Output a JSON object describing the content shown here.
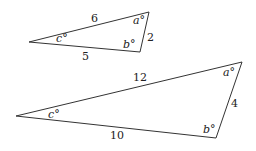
{
  "diagram": {
    "triangles": [
      {
        "name": "small",
        "vertices": {
          "left": [
            29,
            42
          ],
          "top_right": [
            149,
            12
          ],
          "bottom": [
            140,
            52
          ]
        },
        "sides": {
          "top": "6",
          "right": "2",
          "bottom": "5"
        },
        "angles": {
          "a": "a°",
          "b": "b°",
          "c": "c°"
        }
      },
      {
        "name": "large",
        "vertices": {
          "left": [
            16,
            116
          ],
          "top_right": [
            242,
            62
          ],
          "bottom": [
            216,
            138
          ]
        },
        "sides": {
          "top": "12",
          "right": "4",
          "bottom": "10"
        },
        "angles": {
          "a": "a°",
          "b": "b°",
          "c": "c°"
        }
      }
    ],
    "colors": {
      "stroke": "#333333",
      "text": "#222222"
    }
  }
}
